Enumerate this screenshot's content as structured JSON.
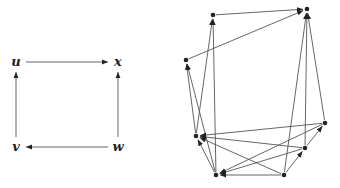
{
  "left_graph": {
    "nodes": [
      {
        "id": "u",
        "label": "u"
      },
      {
        "id": "x",
        "label": "x"
      },
      {
        "id": "v",
        "label": "v"
      },
      {
        "id": "w",
        "label": "w"
      }
    ],
    "edges": [
      {
        "from": "u",
        "to": "x"
      },
      {
        "from": "v",
        "to": "u"
      },
      {
        "from": "w",
        "to": "x"
      },
      {
        "from": "w",
        "to": "v"
      }
    ]
  },
  "right_graph": {
    "nodes": [
      "A",
      "B",
      "C",
      "D",
      "E",
      "F",
      "G",
      "H"
    ],
    "edges": [
      {
        "from": "A",
        "to": "B"
      },
      {
        "from": "C",
        "to": "B"
      },
      {
        "from": "F",
        "to": "B"
      },
      {
        "from": "G",
        "to": "B"
      },
      {
        "from": "H",
        "to": "B"
      },
      {
        "from": "D",
        "to": "A"
      },
      {
        "from": "E",
        "to": "A"
      },
      {
        "from": "D",
        "to": "C"
      },
      {
        "from": "E",
        "to": "C"
      },
      {
        "from": "E",
        "to": "D"
      },
      {
        "from": "F",
        "to": "D"
      },
      {
        "from": "G",
        "to": "D"
      },
      {
        "from": "H",
        "to": "D"
      },
      {
        "from": "F",
        "to": "E"
      },
      {
        "from": "G",
        "to": "E"
      },
      {
        "from": "H",
        "to": "E"
      },
      {
        "from": "F",
        "to": "G"
      },
      {
        "from": "G",
        "to": "H"
      }
    ]
  }
}
